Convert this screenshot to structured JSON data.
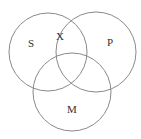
{
  "diagram": {
    "type": "venn",
    "sets": [
      {
        "id": "S",
        "label": "S",
        "cx": 48,
        "cy": 52,
        "r": 39
      },
      {
        "id": "P",
        "label": "P",
        "cx": 96,
        "cy": 52,
        "r": 40
      },
      {
        "id": "M",
        "label": "M",
        "cx": 72,
        "cy": 92,
        "r": 39
      }
    ],
    "labels": {
      "s": "S",
      "p": "P",
      "m": "M",
      "x_mark": "X"
    },
    "stroke_color": "#8a8a8a",
    "text_color": "#333333"
  }
}
